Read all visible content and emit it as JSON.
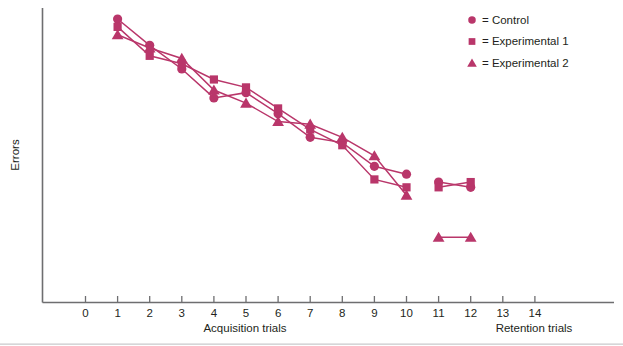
{
  "chart_data": {
    "type": "line",
    "title": "",
    "xlabel": "Acquisition trials",
    "xlabel2": "Retention trials",
    "ylabel": "Errors",
    "grid": false,
    "legend_position": "top-right",
    "x_ticks_acquisition": [
      "0",
      "1",
      "2",
      "3",
      "4",
      "5",
      "6",
      "7",
      "8",
      "9",
      "10"
    ],
    "x_ticks_retention": [
      "11",
      "12",
      "13",
      "14"
    ],
    "xlim": [
      0,
      14
    ],
    "ylim_note": "Errors axis unlabeled (no numeric ticks)",
    "series": [
      {
        "name": "Control",
        "marker": "circle",
        "color": "#b9366a",
        "x": [
          1,
          2,
          3,
          4,
          5,
          6,
          7,
          8,
          9,
          10
        ],
        "y": [
          100,
          90,
          81,
          70,
          72,
          64,
          55,
          53,
          44,
          41
        ],
        "x_retention": [
          11,
          12
        ],
        "y_retention": [
          38,
          36
        ]
      },
      {
        "name": "Experimental 1",
        "marker": "square",
        "color": "#b9366a",
        "x": [
          1,
          2,
          3,
          4,
          5,
          6,
          7,
          8,
          9,
          10
        ],
        "y": [
          97,
          86,
          83,
          77,
          74,
          66,
          58,
          52,
          39,
          36
        ],
        "x_retention": [
          11,
          12
        ],
        "y_retention": [
          36,
          38
        ]
      },
      {
        "name": "Experimental 2",
        "marker": "triangle",
        "color": "#b9366a",
        "x": [
          1,
          2,
          3,
          4,
          5,
          6,
          7,
          8,
          9,
          10
        ],
        "y": [
          94,
          89,
          85,
          73,
          68,
          61,
          60,
          55,
          48,
          33
        ],
        "x_retention": [
          11,
          12
        ],
        "y_retention": [
          17,
          17
        ]
      }
    ]
  },
  "legend": {
    "items": [
      {
        "marker": "circle",
        "equals": "=",
        "label": "Control"
      },
      {
        "marker": "square",
        "equals": "=",
        "label": "Experimental 1"
      },
      {
        "marker": "triangle",
        "equals": "=",
        "label": "Experimental 2"
      }
    ]
  },
  "axes": {
    "y_title": "Errors",
    "x_title_left": "Acquisition trials",
    "x_title_right": "Retention trials",
    "tick_labels": [
      "0",
      "1",
      "2",
      "3",
      "4",
      "5",
      "6",
      "7",
      "8",
      "9",
      "10",
      "11",
      "12",
      "13",
      "14"
    ]
  },
  "colors": {
    "series": "#b9366a",
    "axis": "#6e6e70",
    "text": "#231f20",
    "background": "#ffffff"
  }
}
